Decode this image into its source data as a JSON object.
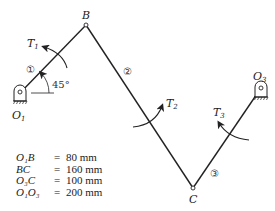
{
  "diagram": {
    "type": "four-bar linkage",
    "joints": {
      "O1": {
        "label": "O",
        "sub": "1"
      },
      "B": {
        "label": "B"
      },
      "C": {
        "label": "C"
      },
      "O3": {
        "label": "O",
        "sub": "3"
      }
    },
    "links": [
      {
        "id": "1",
        "marker": "①",
        "from": "O1",
        "to": "B"
      },
      {
        "id": "2",
        "marker": "②",
        "from": "B",
        "to": "C"
      },
      {
        "id": "3",
        "marker": "③",
        "from": "C",
        "to": "O3"
      }
    ],
    "torques": [
      {
        "label": "T",
        "sub": "1",
        "link": "1"
      },
      {
        "label": "T",
        "sub": "2",
        "link": "2"
      },
      {
        "label": "T",
        "sub": "3",
        "link": "3"
      }
    ],
    "angle": "45°",
    "dimensions": [
      {
        "name": "O₁B",
        "eq": "=",
        "value": "80 mm"
      },
      {
        "name": "BC",
        "eq": "=",
        "value": "160 mm"
      },
      {
        "name": "O₃C",
        "eq": "=",
        "value": "100 mm"
      },
      {
        "name": "O₁O₃",
        "eq": "=",
        "value": "200 mm"
      }
    ]
  }
}
